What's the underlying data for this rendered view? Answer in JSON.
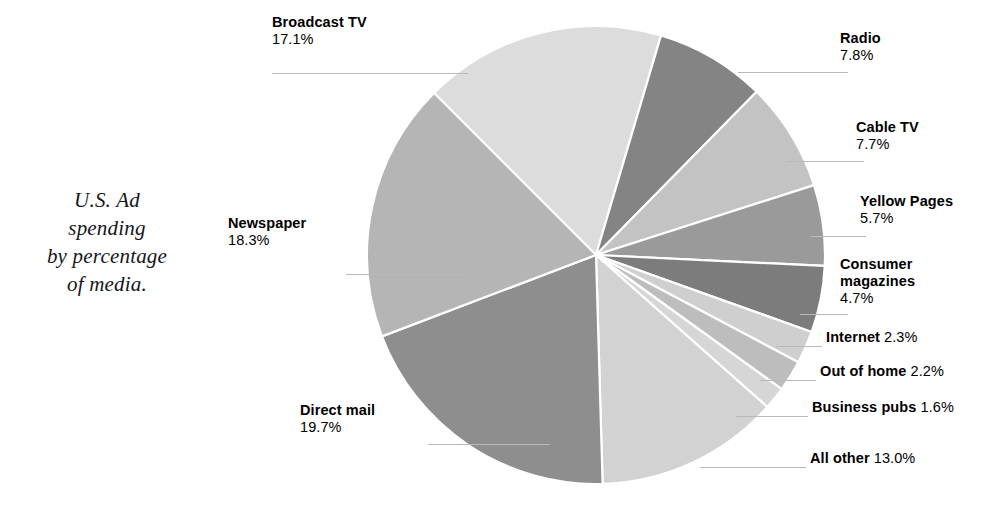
{
  "caption": {
    "line1": "U.S. Ad",
    "line2": "spending",
    "line3": "by percentage",
    "line4": "of media."
  },
  "chart_data": {
    "type": "pie",
    "title": "U.S. Ad spending by percentage of media.",
    "unit": "percent",
    "legend_position": "callout-labels",
    "categories": [
      "Broadcast TV",
      "Radio",
      "Cable TV",
      "Yellow Pages",
      "Consumer magazines",
      "Internet",
      "Out of home",
      "Business pubs",
      "All other",
      "Direct mail",
      "Newspaper"
    ],
    "values": [
      17.1,
      7.8,
      7.7,
      5.7,
      4.7,
      2.3,
      2.2,
      1.6,
      13.0,
      19.7,
      18.3
    ],
    "slices": [
      {
        "label": "Broadcast TV",
        "value": 17.1,
        "value_text": "17.1%",
        "color": "#dcdcdc"
      },
      {
        "label": "Radio",
        "value": 7.8,
        "value_text": "7.8%",
        "color": "#848484"
      },
      {
        "label": "Cable TV",
        "value": 7.7,
        "value_text": "7.7%",
        "color": "#c3c3c3"
      },
      {
        "label": "Yellow Pages",
        "value": 5.7,
        "value_text": "5.7%",
        "color": "#9a9a9a"
      },
      {
        "label": "Consumer magazines",
        "value": 4.7,
        "value_text": "4.7%",
        "color": "#7c7c7c"
      },
      {
        "label": "Internet",
        "value": 2.3,
        "value_text": "2.3%",
        "color": "#cfcfcf"
      },
      {
        "label": "Out of home",
        "value": 2.2,
        "value_text": "2.2%",
        "color": "#bdbdbd"
      },
      {
        "label": "Business pubs",
        "value": 1.6,
        "value_text": "1.6%",
        "color": "#d6d6d6"
      },
      {
        "label": "All other",
        "value": 13.0,
        "value_text": "13.0%",
        "color": "#d2d2d2"
      },
      {
        "label": "Direct mail",
        "value": 19.7,
        "value_text": "19.7%",
        "color": "#8e8e8e"
      },
      {
        "label": "Newspaper",
        "value": 18.3,
        "value_text": "18.3%",
        "color": "#b5b5b5"
      }
    ]
  },
  "labels": {
    "broadcast_tv_name": "Broadcast TV",
    "broadcast_tv_pct": "17.1%",
    "radio_name": "Radio",
    "radio_pct": "7.8%",
    "cable_tv_name": "Cable TV",
    "cable_tv_pct": "7.7%",
    "yellow_pages_name": "Yellow Pages",
    "yellow_pages_pct": "5.7%",
    "consumer_magazines_name_1": "Consumer",
    "consumer_magazines_name_2": "magazines",
    "consumer_magazines_pct": "4.7%",
    "internet_name": "Internet",
    "internet_pct": "2.3%",
    "out_of_home_name": "Out of home",
    "out_of_home_pct": "2.2%",
    "business_pubs_name": "Business pubs",
    "business_pubs_pct": "1.6%",
    "all_other_name": "All other",
    "all_other_pct": "13.0%",
    "direct_mail_name": "Direct mail",
    "direct_mail_pct": "19.7%",
    "newspaper_name": "Newspaper",
    "newspaper_pct": "18.3%"
  }
}
